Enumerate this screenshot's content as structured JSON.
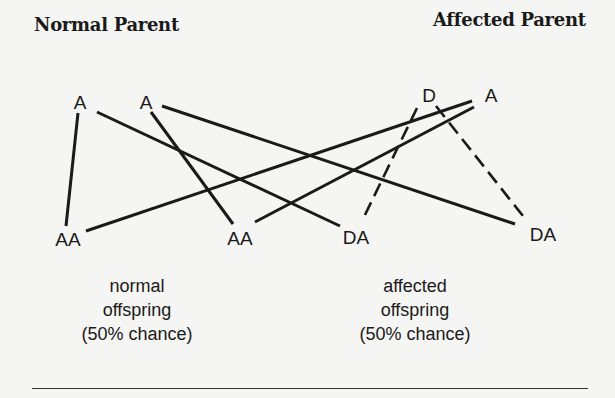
{
  "header": {
    "left_title": "Normal Parent",
    "right_title": "Affected Parent"
  },
  "parents": {
    "normal": [
      {
        "id": "nA1",
        "label": "A",
        "x": 80,
        "y": 102
      },
      {
        "id": "nA2",
        "label": "A",
        "x": 146,
        "y": 102
      }
    ],
    "affected": [
      {
        "id": "aD",
        "label": "D",
        "x": 429,
        "y": 95
      },
      {
        "id": "aA",
        "label": "A",
        "x": 491,
        "y": 95
      }
    ]
  },
  "offspring": [
    {
      "id": "AA1",
      "label": "AA",
      "x": 68,
      "y": 239
    },
    {
      "id": "AA2",
      "label": "AA",
      "x": 240,
      "y": 238
    },
    {
      "id": "DA1",
      "label": "DA",
      "x": 356,
      "y": 237
    },
    {
      "id": "DA2",
      "label": "DA",
      "x": 543,
      "y": 234
    }
  ],
  "connections": [
    {
      "from": "nA1",
      "to": "AA1",
      "style": "solid",
      "x1": 78,
      "y1": 113,
      "x2": 66,
      "y2": 226
    },
    {
      "from": "nA1",
      "to": "DA1",
      "style": "solid",
      "x1": 97,
      "y1": 112,
      "x2": 340,
      "y2": 226
    },
    {
      "from": "nA2",
      "to": "AA2",
      "style": "solid",
      "x1": 151,
      "y1": 112,
      "x2": 233,
      "y2": 224
    },
    {
      "from": "nA2",
      "to": "DA2",
      "style": "solid",
      "x1": 162,
      "y1": 106,
      "x2": 515,
      "y2": 224
    },
    {
      "from": "aA",
      "to": "AA1",
      "style": "solid",
      "x1": 472,
      "y1": 101,
      "x2": 86,
      "y2": 231
    },
    {
      "from": "aA",
      "to": "AA2",
      "style": "solid",
      "x1": 474,
      "y1": 107,
      "x2": 255,
      "y2": 222
    },
    {
      "from": "aD",
      "to": "DA1",
      "style": "dashed",
      "x1": 417,
      "y1": 108,
      "x2": 363,
      "y2": 219
    },
    {
      "from": "aD",
      "to": "DA2",
      "style": "dashed",
      "x1": 436,
      "y1": 106,
      "x2": 523,
      "y2": 216
    }
  ],
  "captions": {
    "normal": {
      "line1": "normal",
      "line2": "offspring",
      "line3": "(50% chance)",
      "x": 137
    },
    "affected": {
      "line1": "affected",
      "line2": "offspring",
      "line3": "(50% chance)",
      "x": 415
    }
  },
  "colors": {
    "ink": "#1a1a1a",
    "paper": "#f5f5f3"
  }
}
